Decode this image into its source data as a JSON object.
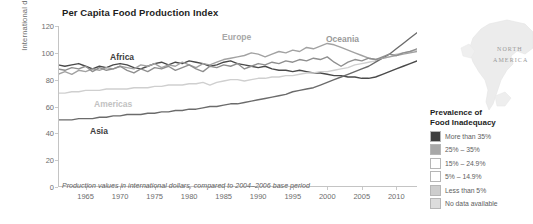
{
  "chart_data": {
    "type": "line",
    "title": "Per Capita Food Production Index",
    "xlabel": "",
    "ylabel": "International dollars",
    "xlim": [
      1961,
      2013
    ],
    "ylim": [
      0,
      120
    ],
    "grid": false,
    "legend_position": "inline-labels",
    "footnote": "Production values in international dollars, compared to 2004–2006 base period",
    "yticks": [
      0,
      20,
      40,
      60,
      80,
      100,
      120
    ],
    "xticks": [
      1965,
      1970,
      1975,
      1980,
      1985,
      1990,
      1995,
      2000,
      2005,
      2010
    ],
    "x": [
      1961,
      1962,
      1963,
      1964,
      1965,
      1966,
      1967,
      1968,
      1969,
      1970,
      1971,
      1972,
      1973,
      1974,
      1975,
      1976,
      1977,
      1978,
      1979,
      1980,
      1981,
      1982,
      1983,
      1984,
      1985,
      1986,
      1987,
      1988,
      1989,
      1990,
      1991,
      1992,
      1993,
      1994,
      1995,
      1996,
      1997,
      1998,
      1999,
      2000,
      2001,
      2002,
      2003,
      2004,
      2005,
      2006,
      2007,
      2008,
      2009,
      2010,
      2011,
      2012,
      2013
    ],
    "series": [
      {
        "name": "Africa",
        "color": "#4a4a4a",
        "label_color": "#3d3d3d",
        "values": [
          91,
          90,
          91,
          92,
          90,
          88,
          90,
          89,
          91,
          92,
          91,
          89,
          88,
          90,
          92,
          93,
          91,
          93,
          92,
          94,
          93,
          92,
          90,
          91,
          93,
          94,
          92,
          91,
          90,
          89,
          90,
          88,
          87,
          87,
          86,
          87,
          86,
          85,
          85,
          84,
          83,
          83,
          82,
          82,
          81,
          81,
          82,
          84,
          86,
          88,
          90,
          92,
          94
        ]
      },
      {
        "name": "Americas",
        "color": "#cfcfcf",
        "label_color": "#c2c2c2",
        "values": [
          70,
          70,
          71,
          71,
          72,
          72,
          72,
          73,
          73,
          73,
          73,
          74,
          74,
          74,
          75,
          75,
          76,
          76,
          76,
          77,
          77,
          78,
          76,
          78,
          79,
          80,
          80,
          79,
          80,
          81,
          81,
          82,
          82,
          83,
          83,
          84,
          85,
          85,
          86,
          86,
          87,
          88,
          89,
          91,
          92,
          93,
          94,
          96,
          97,
          99,
          100,
          101,
          102
        ]
      },
      {
        "name": "Asia",
        "color": "#6b6b6b",
        "label_color": "#3d3d3d",
        "values": [
          50,
          50,
          50,
          51,
          51,
          51,
          52,
          52,
          53,
          53,
          54,
          54,
          54,
          55,
          55,
          56,
          56,
          57,
          57,
          58,
          58,
          59,
          60,
          60,
          61,
          62,
          62,
          63,
          64,
          65,
          66,
          67,
          68,
          69,
          71,
          72,
          73,
          74,
          76,
          78,
          80,
          82,
          84,
          86,
          88,
          90,
          93,
          96,
          99,
          103,
          107,
          111,
          115
        ]
      },
      {
        "name": "Europe",
        "color": "#a2a2a2",
        "label_color": "#a8a8a8",
        "values": [
          84,
          86,
          84,
          87,
          86,
          88,
          87,
          89,
          88,
          90,
          89,
          88,
          91,
          90,
          92,
          89,
          91,
          90,
          93,
          91,
          89,
          92,
          91,
          93,
          95,
          96,
          97,
          98,
          100,
          99,
          97,
          99,
          101,
          100,
          102,
          101,
          104,
          103,
          105,
          107,
          106,
          104,
          102,
          100,
          98,
          96,
          95,
          96,
          97,
          98,
          99,
          100,
          101
        ]
      },
      {
        "name": "Oceania",
        "color": "#8f8f8f",
        "label_color": "#9a9a9a",
        "values": [
          88,
          87,
          89,
          88,
          90,
          86,
          89,
          87,
          88,
          90,
          87,
          85,
          88,
          86,
          89,
          88,
          90,
          87,
          89,
          91,
          88,
          86,
          90,
          89,
          91,
          90,
          92,
          88,
          90,
          92,
          91,
          93,
          92,
          94,
          93,
          95,
          94,
          96,
          95,
          97,
          93,
          90,
          93,
          95,
          94,
          96,
          95,
          97,
          99,
          98,
          100,
          101,
          103
        ]
      }
    ],
    "series_labels": [
      {
        "name": "Africa",
        "x": 110,
        "y": 52
      },
      {
        "name": "Americas",
        "x": 94,
        "y": 99
      },
      {
        "name": "Asia",
        "x": 90,
        "y": 126
      },
      {
        "name": "Europe",
        "x": 222,
        "y": 32
      },
      {
        "name": "Oceania",
        "x": 326,
        "y": 34
      }
    ]
  },
  "map": {
    "region_label_line1": "NORTH",
    "region_label_line2": "AMERICA"
  },
  "legend": {
    "title_line1": "Prevalence of",
    "title_line2": "Food Inadequacy",
    "items": [
      {
        "label": "More than 35%",
        "color": "#3f3f3f"
      },
      {
        "label": "25% – 35%",
        "color": "#a8a8a8"
      },
      {
        "label": "15% – 24.9%",
        "color": "#ffffff"
      },
      {
        "label": "5% – 14.9%",
        "color": "#ffffff"
      },
      {
        "label": "Less than 5%",
        "color": "#cdcdcd"
      },
      {
        "label": "No data available",
        "color": "#dcdcdc"
      }
    ]
  }
}
